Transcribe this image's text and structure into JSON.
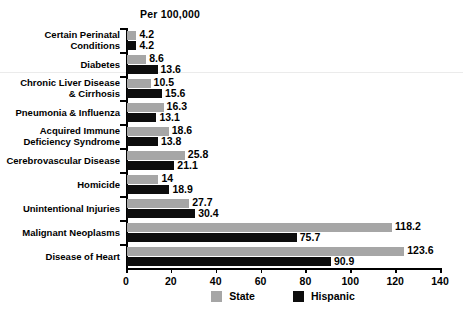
{
  "chart_data": {
    "type": "bar",
    "orientation": "horizontal",
    "title": "Per 100,000",
    "xlabel": "",
    "ylabel": "",
    "xlim": [
      0,
      140
    ],
    "xticks": [
      0,
      20,
      40,
      60,
      80,
      100,
      120,
      140
    ],
    "grid": false,
    "legend_position": "bottom",
    "categories": [
      "Certain Perinatal\nConditions",
      "Diabetes",
      "Chronic Liver Disease\n& Cirrhosis",
      "Pneumonia & Influenza",
      "Acquired Immune\nDeficiency Syndrome",
      "Cerebrovascular Disease",
      "Homicide",
      "Unintentional Injuries",
      "Malignant Neoplasms",
      "Disease of Heart"
    ],
    "series": [
      {
        "name": "State",
        "color": "#a6a6a6",
        "values": [
          4.2,
          8.6,
          10.5,
          16.3,
          18.6,
          25.8,
          14,
          27.7,
          118.2,
          123.6
        ],
        "labels": [
          "4.2",
          "8.6",
          "10.5",
          "16.3",
          "18.6",
          "25.8",
          "14",
          "27.7",
          "118.2",
          "123.6"
        ]
      },
      {
        "name": "Hispanic",
        "color": "#0d0d0d",
        "values": [
          4.2,
          13.6,
          15.6,
          13.1,
          13.8,
          21.1,
          18.9,
          30.4,
          75.7,
          90.9
        ],
        "labels": [
          "4.2",
          "13.6",
          "15.6",
          "13.1",
          "13.8",
          "21.1",
          "18.9",
          "30.4",
          "75.7",
          "90.9"
        ]
      }
    ]
  },
  "legend": {
    "items": [
      {
        "label": "State",
        "color": "#a6a6a6"
      },
      {
        "label": "Hispanic",
        "color": "#0d0d0d"
      }
    ]
  }
}
